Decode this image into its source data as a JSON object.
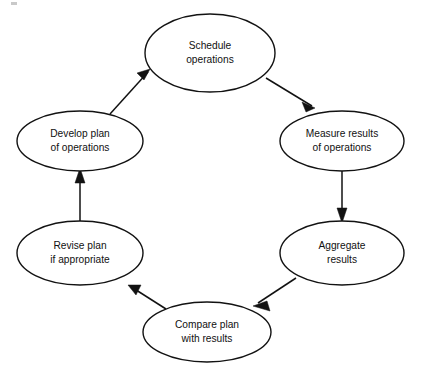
{
  "diagram": {
    "background_color": "#ffffff",
    "stroke_color": "#121212",
    "text_color": "#111111",
    "nodes": [
      {
        "id": "schedule-operations",
        "line1": "Schedule",
        "line2": "operations",
        "cx": 210,
        "cy": 53,
        "rx": 65,
        "ry": 39
      },
      {
        "id": "measure-results",
        "line1": "Measure results",
        "line2": "of operations",
        "cx": 342,
        "cy": 141,
        "rx": 62,
        "ry": 30
      },
      {
        "id": "aggregate-results",
        "line1": "Aggregate",
        "line2": "results",
        "cx": 342,
        "cy": 253,
        "rx": 62,
        "ry": 32
      },
      {
        "id": "compare-plan",
        "line1": "Compare plan",
        "line2": "with results",
        "cx": 207,
        "cy": 332,
        "rx": 64,
        "ry": 30
      },
      {
        "id": "revise-plan",
        "line1": "Revise plan",
        "line2": "if appropriate",
        "cx": 80,
        "cy": 253,
        "rx": 63,
        "ry": 32
      },
      {
        "id": "develop-plan",
        "line1": "Develop plan",
        "line2": "of operations",
        "cx": 80,
        "cy": 141,
        "rx": 63,
        "ry": 30
      }
    ],
    "arrows": [
      {
        "id": "develop-to-schedule",
        "from": "develop-plan",
        "to": "schedule-operations",
        "kind": "diagonal-up-right"
      },
      {
        "id": "schedule-to-measure",
        "from": "schedule-operations",
        "to": "measure-results",
        "kind": "diagonal-down-right"
      },
      {
        "id": "measure-to-aggregate",
        "from": "measure-results",
        "to": "aggregate-results",
        "kind": "vertical-down"
      },
      {
        "id": "aggregate-to-compare",
        "from": "aggregate-results",
        "to": "compare-plan",
        "kind": "diagonal-down-left"
      },
      {
        "id": "compare-to-revise",
        "from": "compare-plan",
        "to": "revise-plan",
        "kind": "diagonal-up-left"
      },
      {
        "id": "revise-to-develop",
        "from": "revise-plan",
        "to": "develop-plan",
        "kind": "vertical-up"
      }
    ]
  }
}
